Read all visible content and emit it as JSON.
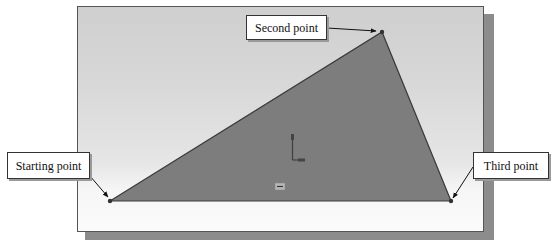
{
  "diagram": {
    "title": "",
    "viewport": {
      "background": "#d6d6d6",
      "border_color": "#555555",
      "shadow_color": "#8c8c8c"
    },
    "triangle": {
      "fill": "#7d7d7d",
      "stroke": "#3a3a3a",
      "vertices": [
        {
          "name": "Starting point",
          "x": 110,
          "y": 201
        },
        {
          "name": "Second point",
          "x": 382,
          "y": 32
        },
        {
          "name": "Third point",
          "x": 451,
          "y": 201
        }
      ]
    },
    "callouts": {
      "second": {
        "label": "Second point"
      },
      "starting": {
        "label": "Starting point"
      },
      "third": {
        "label": "Third point"
      }
    },
    "icons": {
      "origin": "origin-axes-icon",
      "dimension": "dimension-marker-icon"
    }
  }
}
